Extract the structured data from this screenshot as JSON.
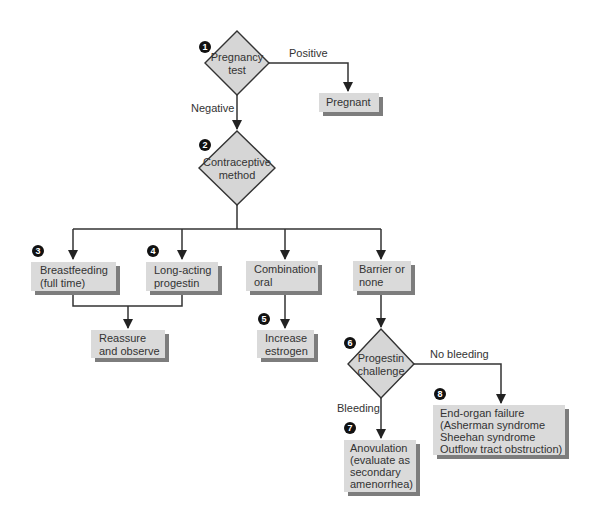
{
  "diagram": {
    "decisions": [
      {
        "id": "d1",
        "badge": "1",
        "lines": [
          "Pregnancy",
          "test"
        ]
      },
      {
        "id": "d2",
        "badge": "2",
        "lines": [
          "Contraceptive",
          "method"
        ]
      },
      {
        "id": "d6",
        "badge": "6",
        "lines": [
          "Progestin",
          "challenge"
        ]
      }
    ],
    "boxes": [
      {
        "id": "pregnant",
        "badge": "",
        "lines": [
          "Pregnant"
        ]
      },
      {
        "id": "breastfeeding",
        "badge": "3",
        "lines": [
          "Breastfeeding",
          "(full time)"
        ]
      },
      {
        "id": "longacting",
        "badge": "4",
        "lines": [
          "Long-acting",
          "progestin"
        ]
      },
      {
        "id": "combination",
        "badge": "",
        "lines": [
          "Combination",
          "oral"
        ]
      },
      {
        "id": "barrier",
        "badge": "",
        "lines": [
          "Barrier or",
          "none"
        ]
      },
      {
        "id": "reassure",
        "badge": "",
        "lines": [
          "Reassure",
          "and observe"
        ]
      },
      {
        "id": "estrogen",
        "badge": "5",
        "lines": [
          "Increase",
          "estrogen"
        ]
      },
      {
        "id": "anovulation",
        "badge": "7",
        "lines": [
          "Anovulation",
          "(evaluate as",
          "secondary",
          "amenorrhea)"
        ]
      },
      {
        "id": "endorgan",
        "badge": "8",
        "lines": [
          "End-organ failure",
          "(Asherman syndrome",
          "Sheehan syndrome",
          "Outflow tract obstruction)"
        ]
      }
    ],
    "edge_labels": {
      "positive": "Positive",
      "negative": "Negative",
      "no_bleeding": "No bleeding",
      "bleeding": "Bleeding"
    }
  }
}
